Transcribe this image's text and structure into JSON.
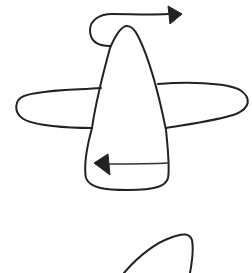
{
  "drawing": {
    "description": "Hand-drawn sketch of an airplane-like shape viewed from above with two motion arrows",
    "stroke_color": "#222222",
    "background_color": "#ffffff",
    "elements": [
      {
        "name": "fuselage",
        "shape": "tall rounded tapered body"
      },
      {
        "name": "left-wing",
        "shape": "elongated rounded lobe"
      },
      {
        "name": "right-wing",
        "shape": "elongated rounded lobe"
      },
      {
        "name": "top-arrow",
        "direction": "right",
        "shape": "curved loop from nose to right"
      },
      {
        "name": "bottom-arrow",
        "direction": "left",
        "shape": "straight arrow inside tail"
      },
      {
        "name": "partial-shape",
        "shape": "curved stroke at bottom, cut off"
      }
    ]
  }
}
